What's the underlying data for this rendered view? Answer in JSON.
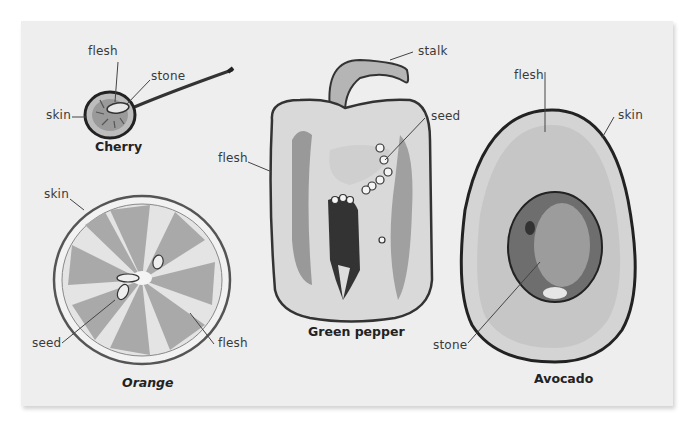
{
  "diagram": {
    "background": "#eeeeee",
    "items": [
      {
        "name": "Cherry",
        "labels": {
          "flesh": "flesh",
          "stone": "stone",
          "skin": "skin"
        }
      },
      {
        "name": "Orange",
        "labels": {
          "skin": "skin",
          "seed": "seed",
          "flesh": "flesh"
        }
      },
      {
        "name": "Green pepper",
        "labels": {
          "stalk": "stalk",
          "seed": "seed",
          "flesh": "flesh"
        }
      },
      {
        "name": "Avocado",
        "labels": {
          "flesh": "flesh",
          "skin": "skin",
          "stone": "stone"
        }
      }
    ]
  }
}
